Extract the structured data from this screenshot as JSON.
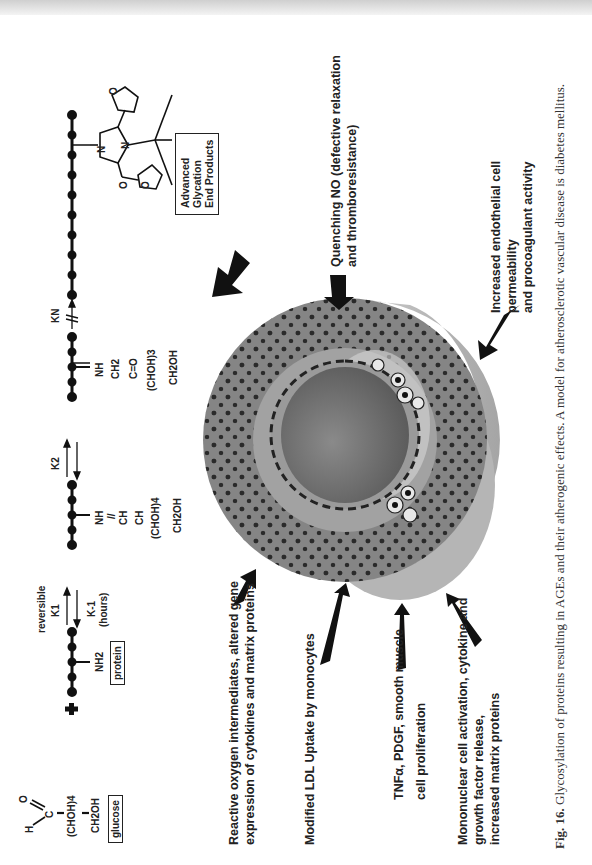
{
  "figure": {
    "caption_label": "Fig. 16.",
    "caption_text": " Glycosylation of proteins resulting in AGEs and their atherogenic effects. A model for atherosclerotic vascular disease is diabetes mellitus.",
    "orientation": "rotated 90° counter-clockwise",
    "chemistry": {
      "glucose": {
        "aldehyde_h": "H",
        "aldehyde_o": "O",
        "carbon": "C",
        "chain": "(CHOH)4",
        "terminal": "CH2OH",
        "box_label": "glucose"
      },
      "plus": "+",
      "protein": {
        "group": "NH2",
        "box_label": "protein"
      },
      "step1": {
        "top_label": "reversible",
        "rate_forward": "K1",
        "rate_reverse": "K-1",
        "rate_reverse_note": "(hours)"
      },
      "schiff_base": [
        "NH",
        "//",
        "CH",
        "CH",
        "(CHOH)4",
        "CH2OH"
      ],
      "step2": {
        "rate": "K2"
      },
      "amadori": [
        "NH",
        "CH2",
        "C=O",
        "(CHOH)3",
        "CH2OH"
      ],
      "step3": {
        "rate": "KN",
        "break_mark": "//"
      },
      "age_structure": {
        "atoms": [
          "N",
          "N",
          "O",
          "O",
          "O"
        ]
      },
      "age_box": [
        "Advanced",
        "Glycation",
        "End Products"
      ]
    },
    "effects": [
      {
        "id": "reactive-oxygen",
        "lines": [
          "Reactive oxygen intermediates, altered gene",
          "expression of cytokines and matrix proteins"
        ]
      },
      {
        "id": "modified-ldl",
        "lines": [
          "Modified LDL Uptake by monocytes"
        ]
      },
      {
        "id": "tnf-pdgf",
        "lines": [
          "TNFα, PDGF, smooth muscle",
          "cell proliferation"
        ]
      },
      {
        "id": "mononuclear",
        "lines": [
          "Mononuclear cell activation, cytokine and",
          "growth factor release,",
          "increased matrix proteins"
        ]
      },
      {
        "id": "quenching-no",
        "lines": [
          "Quenching NO (defective relaxation",
          "and thromboresistance)"
        ]
      },
      {
        "id": "endothelial",
        "lines": [
          "Increased endothelial cell",
          "permeability",
          "and  procoagulant activity"
        ]
      }
    ],
    "colors": {
      "text": "#222222",
      "vessel_outer": "#8a8a8a",
      "vessel_media": "#7d7d7d",
      "vessel_intima": "#a8a8a8",
      "lumen": "#6e6e6e",
      "vessel_side": "#b9b9b9"
    }
  }
}
